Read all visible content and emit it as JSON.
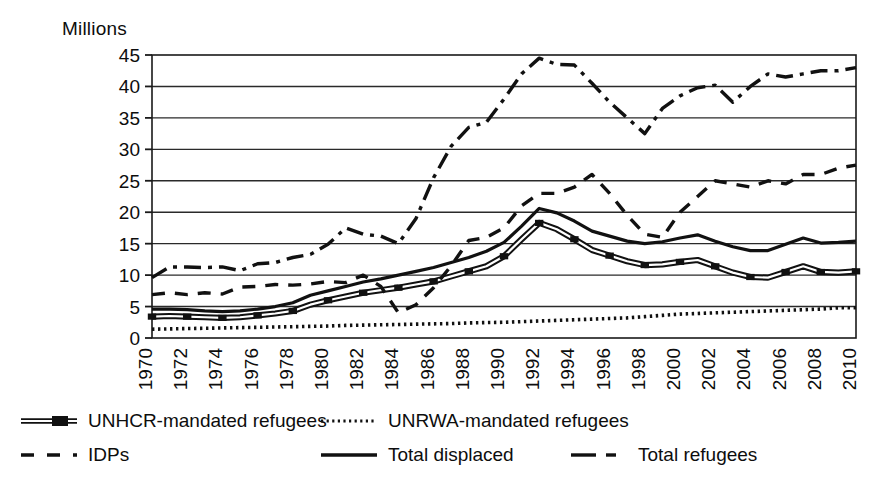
{
  "axis": {
    "y_title": "Millions",
    "y_ticks": [
      0,
      5,
      10,
      15,
      20,
      25,
      30,
      35,
      40,
      45
    ],
    "x_ticks": [
      "1970",
      "1972",
      "1974",
      "1976",
      "1978",
      "1980",
      "1982",
      "1984",
      "1986",
      "1988",
      "1990",
      "1992",
      "1994",
      "1996",
      "1998",
      "2000",
      "2002",
      "2004",
      "2006",
      "2008",
      "2010"
    ]
  },
  "legend": {
    "items": [
      {
        "name": "unhcr",
        "label": "UNHCR-mandated refugees",
        "style": "line-marker"
      },
      {
        "name": "unrwa",
        "label": "UNRWA-mandated refugees",
        "style": "dotted"
      },
      {
        "name": "idps",
        "label": "IDPs",
        "style": "dashed"
      },
      {
        "name": "total-displaced",
        "label": "Total displaced",
        "style": "solid"
      },
      {
        "name": "total-refugees",
        "label": "Total refugees",
        "style": "dash-dot"
      }
    ]
  },
  "chart_data": {
    "type": "line",
    "title": "",
    "xlabel": "",
    "ylabel": "Millions",
    "xlim": [
      1970,
      2010
    ],
    "ylim": [
      0,
      45
    ],
    "grid": true,
    "legend_position": "bottom",
    "x": [
      1970,
      1971,
      1972,
      1973,
      1974,
      1975,
      1976,
      1977,
      1978,
      1979,
      1980,
      1981,
      1982,
      1983,
      1984,
      1985,
      1986,
      1987,
      1988,
      1989,
      1990,
      1991,
      1992,
      1993,
      1994,
      1995,
      1996,
      1997,
      1998,
      1999,
      2000,
      2001,
      2002,
      2003,
      2004,
      2005,
      2006,
      2007,
      2008,
      2009,
      2010
    ],
    "series": [
      {
        "name": "UNHCR-mandated refugees",
        "style": "line-marker",
        "values": [
          3.4,
          3.5,
          3.4,
          3.3,
          3.2,
          3.3,
          3.6,
          3.9,
          4.3,
          5.3,
          6.0,
          6.6,
          7.2,
          7.6,
          8.0,
          8.5,
          9.0,
          9.8,
          10.6,
          11.4,
          13.0,
          15.7,
          18.3,
          17.3,
          15.7,
          14.0,
          13.1,
          12.2,
          11.6,
          11.7,
          12.1,
          12.4,
          11.4,
          10.4,
          9.7,
          9.6,
          10.5,
          11.4,
          10.5,
          10.4,
          10.6
        ]
      },
      {
        "name": "UNRWA-mandated refugees",
        "style": "dotted",
        "values": [
          1.4,
          1.45,
          1.5,
          1.55,
          1.6,
          1.65,
          1.7,
          1.75,
          1.8,
          1.85,
          1.9,
          2.0,
          2.05,
          2.1,
          2.15,
          2.2,
          2.25,
          2.3,
          2.4,
          2.45,
          2.5,
          2.6,
          2.7,
          2.8,
          2.9,
          3.0,
          3.1,
          3.2,
          3.4,
          3.6,
          3.8,
          3.9,
          4.0,
          4.1,
          4.2,
          4.3,
          4.4,
          4.5,
          4.6,
          4.8,
          4.8
        ]
      },
      {
        "name": "IDPs",
        "style": "dashed",
        "values": [
          6.9,
          7.2,
          6.9,
          7.2,
          7.0,
          8.1,
          8.2,
          8.5,
          8.4,
          8.6,
          9.0,
          8.8,
          10.0,
          8.2,
          4.0,
          5.3,
          8.0,
          11.5,
          15.5,
          16.0,
          17.5,
          21.0,
          23.0,
          23.0,
          24.0,
          26.0,
          23.0,
          19.5,
          16.5,
          16.0,
          20.0,
          22.5,
          25.0,
          24.5,
          24.0,
          25.0,
          24.5,
          26.0,
          26.0,
          27.0,
          27.5
        ]
      },
      {
        "name": "Total displaced",
        "style": "solid",
        "values": [
          4.6,
          4.6,
          4.5,
          4.3,
          4.2,
          4.3,
          4.6,
          5.0,
          5.6,
          6.8,
          7.5,
          8.2,
          8.9,
          9.4,
          10.0,
          10.6,
          11.2,
          12.0,
          12.8,
          13.8,
          15.2,
          17.8,
          20.6,
          19.9,
          18.6,
          17.0,
          16.2,
          15.4,
          15.0,
          15.3,
          15.9,
          16.4,
          15.4,
          14.5,
          13.9,
          13.9,
          14.9,
          15.9,
          15.1,
          15.2,
          15.4
        ]
      },
      {
        "name": "Total refugees",
        "style": "dash-dot",
        "values": [
          9.6,
          11.3,
          11.3,
          11.2,
          11.3,
          10.7,
          11.8,
          12.0,
          12.8,
          13.3,
          14.9,
          17.5,
          16.5,
          16.2,
          15.0,
          19.0,
          25.5,
          30.5,
          33.5,
          34.3,
          38.0,
          42.0,
          44.5,
          43.5,
          43.4,
          40.5,
          37.5,
          35.0,
          32.5,
          36.5,
          38.5,
          39.8,
          40.2,
          37.5,
          40.0,
          42.0,
          41.5,
          42.0,
          42.5,
          42.5,
          43.0
        ]
      }
    ]
  }
}
